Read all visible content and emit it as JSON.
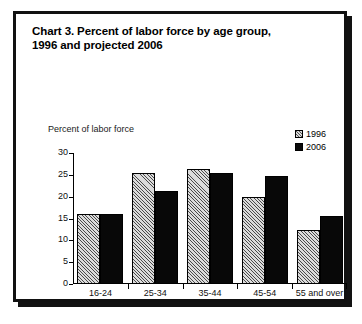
{
  "figure": {
    "title_line1": "Chart 3. Percent of labor force by age group,",
    "title_line2": "1996 and projected 2006"
  },
  "chart_data": {
    "type": "bar",
    "title": "Chart 3. Percent of labor force by age group, 1996 and projected 2006",
    "xlabel": "",
    "ylabel": "Percent of labor force",
    "categories": [
      "16-24",
      "25-34",
      "35-44",
      "45-54",
      "55 and over"
    ],
    "series": [
      {
        "name": "1996",
        "values": [
          16.1,
          25.4,
          26.4,
          19.9,
          12.3
        ],
        "fill": "hatched",
        "color": "#dcdcdc"
      },
      {
        "name": "2006",
        "values": [
          16.1,
          21.4,
          25.5,
          24.8,
          15.6
        ],
        "fill": "solid",
        "color": "#080808"
      }
    ],
    "ylim": [
      0,
      30
    ],
    "yticks": [
      0,
      5,
      10,
      15,
      20,
      25,
      30
    ],
    "ytick_labels": [
      "0",
      "5",
      "10",
      "15",
      "20",
      "25",
      "30"
    ],
    "grid": false,
    "legend_position": "top-right"
  }
}
